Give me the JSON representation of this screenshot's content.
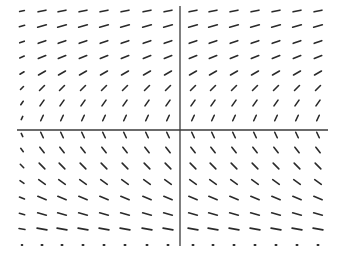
{
  "diagram": {
    "type": "slope-field",
    "background": "#ffffff",
    "stroke": "#2a2a2a",
    "axes": {
      "x_axis": {
        "y": 130,
        "x1": 17,
        "x2": 328
      },
      "y_axis": {
        "x": 180,
        "y1": 6,
        "y2": 246
      }
    },
    "columns_x": [
      22,
      42,
      62,
      83,
      104,
      125,
      147,
      168,
      193,
      213,
      234,
      255,
      276,
      297,
      318
    ],
    "rows": [
      {
        "y": 11,
        "angle_deg": -12,
        "len": 8
      },
      {
        "y": 26,
        "angle_deg": -16,
        "len": 9
      },
      {
        "y": 42,
        "angle_deg": -20,
        "len": 8
      },
      {
        "y": 57,
        "angle_deg": -22,
        "len": 8
      },
      {
        "y": 73,
        "angle_deg": -30,
        "len": 8
      },
      {
        "y": 88,
        "angle_deg": -45,
        "len": 7
      },
      {
        "y": 103,
        "angle_deg": -55,
        "len": 7
      },
      {
        "y": 118,
        "angle_deg": -65,
        "len": 6
      },
      {
        "y": 135,
        "angle_deg": 65,
        "len": 6
      },
      {
        "y": 150,
        "angle_deg": 52,
        "len": 7
      },
      {
        "y": 166,
        "angle_deg": 45,
        "len": 8
      },
      {
        "y": 182,
        "angle_deg": 35,
        "len": 8
      },
      {
        "y": 198,
        "angle_deg": 22,
        "len": 9
      },
      {
        "y": 214,
        "angle_deg": 15,
        "len": 9
      },
      {
        "y": 229,
        "angle_deg": 10,
        "len": 10
      },
      {
        "y": 245,
        "angle_deg": 0,
        "len": 1
      }
    ],
    "first_column_scale": 0.6
  }
}
